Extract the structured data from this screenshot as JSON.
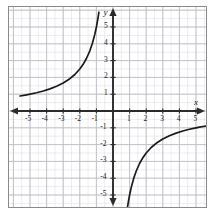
{
  "chart_data": {
    "type": "line",
    "title": "",
    "xlabel": "x",
    "ylabel": "y",
    "equation": "y = -5/x",
    "xlim": [
      -5.9,
      5.9
    ],
    "ylim": [
      -5.9,
      5.9
    ],
    "grid": true,
    "minor_grid": true,
    "minor_grid_divisions": 2,
    "legend": "none",
    "x_ticks": [
      -5,
      -4,
      -3,
      -2,
      -1,
      1,
      2,
      3,
      4,
      5
    ],
    "y_ticks": [
      5,
      4,
      3,
      2,
      1,
      -1,
      -2,
      -3,
      -4,
      -5
    ],
    "x_tick_labels": [
      "-5",
      "-4",
      "-3",
      "-2",
      "-1",
      "1",
      "2",
      "3",
      "4",
      "5"
    ],
    "y_tick_labels": [
      "5",
      "4",
      "3",
      "2",
      "1",
      "-1",
      "-2",
      "-3",
      "-4",
      "-5"
    ],
    "asymptotes": {
      "vertical": 0,
      "horizontal": 0
    },
    "series": [
      {
        "name": "branch-quadrant-II",
        "quadrant": "II",
        "points": [
          [
            -5.6,
            0.893
          ],
          [
            -5.2,
            0.962
          ],
          [
            -5.0,
            1.0
          ],
          [
            -4.6,
            1.087
          ],
          [
            -4.2,
            1.19
          ],
          [
            -3.8,
            1.316
          ],
          [
            -3.4,
            1.471
          ],
          [
            -3.0,
            1.667
          ],
          [
            -2.6,
            1.923
          ],
          [
            -2.3,
            2.174
          ],
          [
            -2.0,
            2.5
          ],
          [
            -1.8,
            2.778
          ],
          [
            -1.6,
            3.125
          ],
          [
            -1.4,
            3.571
          ],
          [
            -1.25,
            4.0
          ],
          [
            -1.1,
            4.545
          ],
          [
            -1.0,
            5.0
          ],
          [
            -0.93,
            5.38
          ],
          [
            -0.88,
            5.68
          ],
          [
            -0.85,
            5.88
          ]
        ]
      },
      {
        "name": "branch-quadrant-IV",
        "quadrant": "IV",
        "points": [
          [
            0.85,
            -5.88
          ],
          [
            0.88,
            -5.68
          ],
          [
            0.93,
            -5.38
          ],
          [
            1.0,
            -5.0
          ],
          [
            1.1,
            -4.545
          ],
          [
            1.25,
            -4.0
          ],
          [
            1.4,
            -3.571
          ],
          [
            1.6,
            -3.125
          ],
          [
            1.8,
            -2.778
          ],
          [
            2.0,
            -2.5
          ],
          [
            2.3,
            -2.174
          ],
          [
            2.6,
            -1.923
          ],
          [
            3.0,
            -1.667
          ],
          [
            3.4,
            -1.471
          ],
          [
            3.8,
            -1.316
          ],
          [
            4.2,
            -1.19
          ],
          [
            4.6,
            -1.087
          ],
          [
            5.0,
            -1.0
          ],
          [
            5.2,
            -0.962
          ],
          [
            5.6,
            -0.893
          ]
        ]
      }
    ]
  },
  "colors": {
    "curve": "#1a1a1a",
    "axis": "#2b2b2b",
    "major_grid": "#b9bcc4",
    "minor_grid": "#dfe1e6",
    "frame": "#8a8a8a",
    "label_text": "#1a1a1a",
    "background": "#ffffff"
  },
  "axes": {
    "x_axis_name": "x",
    "y_axis_name": "y",
    "x_arrow_left": "arrow-left",
    "x_arrow_right": "arrow-right",
    "y_arrow_up": "arrow-up",
    "y_arrow_down": "arrow-down"
  }
}
